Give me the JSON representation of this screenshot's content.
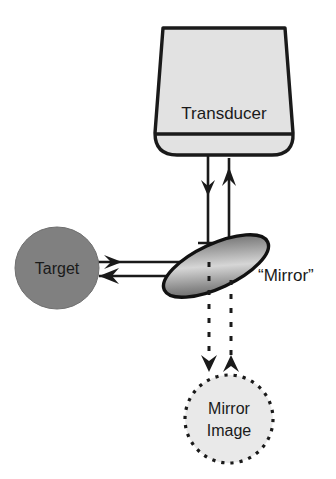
{
  "figure": {
    "type": "schematic-diagram",
    "title_visible": false,
    "width": 336,
    "height": 479,
    "background_color": "#ffffff"
  },
  "labels": {
    "transducer": "Transducer",
    "target": "Target",
    "mirror": "“Mirror”",
    "mirror_image_line1": "Mirror",
    "mirror_image_line2": "Image"
  },
  "colors": {
    "stroke": "#1a1a1a",
    "transducer_fill": "#e2e2e2",
    "transducer_face_fill": "#dcdcdc",
    "target_fill": "#808080",
    "mirror_fill_light": "#d9d9d9",
    "mirror_fill_dark": "#585858",
    "mirror_image_fill": "#e9e9e9",
    "text": "#1a1a1a",
    "background": "#ffffff"
  },
  "components": [
    {
      "name": "transducer",
      "shape": "tapered-probe",
      "label": "Transducer",
      "fill": "#e2e2e2",
      "outline": "#1a1a1a",
      "position": {
        "x": 160,
        "y": 28,
        "width": 128,
        "height": 130
      }
    },
    {
      "name": "target",
      "shape": "ellipse",
      "label": "Target",
      "fill": "#808080",
      "position": {
        "cx": 57,
        "cy": 268,
        "rx": 42,
        "ry": 40
      }
    },
    {
      "name": "mirror",
      "shape": "rotated-ellipse",
      "label": "“Mirror”",
      "fill": "gradient",
      "rotation_deg": -25,
      "position": {
        "cx": 216,
        "cy": 265,
        "rx": 56,
        "ry": 22
      }
    },
    {
      "name": "mirror-image",
      "shape": "dotted-circle",
      "label": "Mirror Image",
      "fill": "#e9e9e9",
      "border_style": "dotted",
      "position": {
        "cx": 229,
        "cy": 419,
        "r": 44
      }
    }
  ],
  "beams": [
    {
      "name": "transmit-beam-down",
      "style": "solid",
      "direction": "down",
      "from": "transducer",
      "to": "mirror"
    },
    {
      "name": "receive-beam-up",
      "style": "solid",
      "direction": "up",
      "from": "mirror",
      "to": "transducer"
    },
    {
      "name": "reflected-beam-to-target",
      "style": "solid",
      "direction": "left",
      "from": "mirror",
      "to": "target"
    },
    {
      "name": "returning-beam-from-target",
      "style": "solid",
      "direction": "left",
      "from": "target",
      "to": "mirror"
    },
    {
      "name": "virtual-beam-down",
      "style": "dashed",
      "direction": "down",
      "from": "mirror",
      "to": "mirror-image"
    },
    {
      "name": "virtual-beam-up",
      "style": "dashed",
      "direction": "up",
      "from": "mirror-image",
      "to": "mirror"
    }
  ],
  "markers": [
    {
      "name": "right-angle-marker",
      "description": "square indicating 90 degrees between vertical and horizontal beams",
      "position": {
        "x": 198,
        "y": 243,
        "size": 20
      }
    }
  ]
}
